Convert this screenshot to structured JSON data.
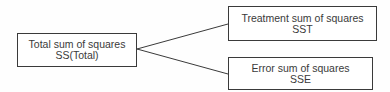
{
  "diagram": {
    "type": "tree",
    "nodes": [
      {
        "id": "total",
        "line1": "Total sum of squares",
        "line2": "SS(Total)"
      },
      {
        "id": "sst",
        "line1": "Treatment sum of squares",
        "line2": "SST"
      },
      {
        "id": "sse",
        "line1": "Error sum of squares",
        "line2": "SSE"
      }
    ],
    "edges": [
      {
        "from": "total",
        "to": "sst"
      },
      {
        "from": "total",
        "to": "sse"
      }
    ],
    "colors": {
      "stroke": "#3a3a3a",
      "text": "#3a3a3a",
      "background": "#ffffff"
    }
  }
}
